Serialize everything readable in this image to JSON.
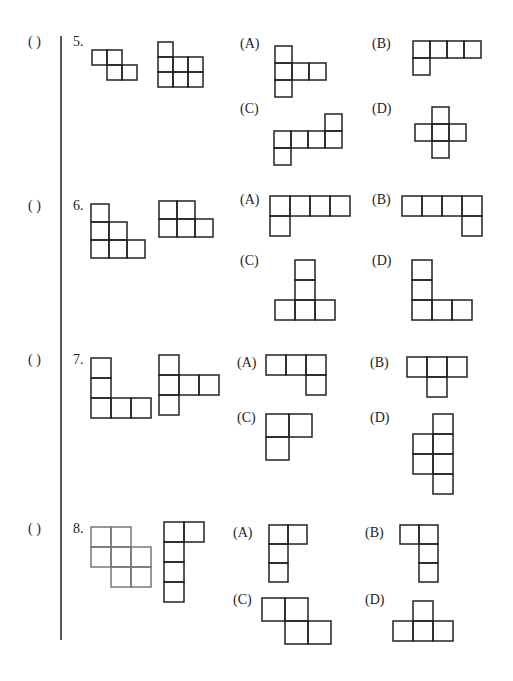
{
  "worksheet": {
    "questions": [
      {
        "number": "5.",
        "answer_blank": "(     )",
        "layout": {
          "paren": [
            28,
            34
          ],
          "num": [
            73,
            34
          ]
        },
        "given_shapes": [
          {
            "origin": [
              92,
              50
            ],
            "cell": 15,
            "stroke": "#222222",
            "cells": [
              [
                0,
                0
              ],
              [
                1,
                0
              ],
              [
                1,
                1
              ],
              [
                2,
                1
              ]
            ]
          },
          {
            "origin": [
              158,
              42
            ],
            "cell": 15,
            "stroke": "#222222",
            "cells": [
              [
                0,
                0
              ],
              [
                0,
                1
              ],
              [
                1,
                1
              ],
              [
                2,
                1
              ],
              [
                0,
                2
              ],
              [
                1,
                2
              ],
              [
                2,
                2
              ]
            ]
          }
        ],
        "options": [
          {
            "label": "(A)",
            "label_pos": [
              240,
              36
            ],
            "origin": [
              275,
              46
            ],
            "cell": 17,
            "cells": [
              [
                0,
                0
              ],
              [
                0,
                1
              ],
              [
                1,
                1
              ],
              [
                2,
                1
              ],
              [
                0,
                2
              ]
            ]
          },
          {
            "label": "(B)",
            "label_pos": [
              372,
              36
            ],
            "origin": [
              413,
              41
            ],
            "cell": 17,
            "cells": [
              [
                0,
                0
              ],
              [
                1,
                0
              ],
              [
                2,
                0
              ],
              [
                3,
                0
              ],
              [
                0,
                1
              ]
            ]
          },
          {
            "label": "(C)",
            "label_pos": [
              240,
              101
            ],
            "origin": [
              274,
              114
            ],
            "cell": 17,
            "cells": [
              [
                3,
                0
              ],
              [
                0,
                1
              ],
              [
                1,
                1
              ],
              [
                2,
                1
              ],
              [
                3,
                1
              ],
              [
                0,
                2
              ]
            ]
          },
          {
            "label": "(D)",
            "label_pos": [
              372,
              101
            ],
            "origin": [
              415,
              107
            ],
            "cell": 17,
            "cells": [
              [
                1,
                0
              ],
              [
                0,
                1
              ],
              [
                1,
                1
              ],
              [
                2,
                1
              ],
              [
                1,
                2
              ]
            ]
          }
        ]
      },
      {
        "number": "6.",
        "answer_blank": "(     )",
        "layout": {
          "paren": [
            28,
            198
          ],
          "num": [
            73,
            198
          ]
        },
        "given_shapes": [
          {
            "origin": [
              91,
              204
            ],
            "cell": 18,
            "stroke": "#222222",
            "cells": [
              [
                0,
                0
              ],
              [
                0,
                1
              ],
              [
                1,
                1
              ],
              [
                0,
                2
              ],
              [
                1,
                2
              ],
              [
                2,
                2
              ]
            ]
          },
          {
            "origin": [
              159,
              201
            ],
            "cell": 18,
            "stroke": "#222222",
            "cells": [
              [
                0,
                0
              ],
              [
                1,
                0
              ],
              [
                0,
                1
              ],
              [
                1,
                1
              ],
              [
                2,
                1
              ]
            ]
          }
        ],
        "options": [
          {
            "label": "(A)",
            "label_pos": [
              240,
              192
            ],
            "origin": [
              270,
              196
            ],
            "cell": 20,
            "cells": [
              [
                0,
                0
              ],
              [
                1,
                0
              ],
              [
                2,
                0
              ],
              [
                3,
                0
              ],
              [
                0,
                1
              ]
            ]
          },
          {
            "label": "(B)",
            "label_pos": [
              372,
              192
            ],
            "origin": [
              402,
              196
            ],
            "cell": 20,
            "cells": [
              [
                0,
                0
              ],
              [
                1,
                0
              ],
              [
                2,
                0
              ],
              [
                3,
                0
              ],
              [
                3,
                1
              ]
            ]
          },
          {
            "label": "(C)",
            "label_pos": [
              240,
              253
            ],
            "origin": [
              275,
              260
            ],
            "cell": 20,
            "cells": [
              [
                1,
                0
              ],
              [
                1,
                1
              ],
              [
                0,
                2
              ],
              [
                1,
                2
              ],
              [
                2,
                2
              ]
            ]
          },
          {
            "label": "(D)",
            "label_pos": [
              372,
              253
            ],
            "origin": [
              412,
              260
            ],
            "cell": 20,
            "cells": [
              [
                0,
                0
              ],
              [
                0,
                1
              ],
              [
                0,
                2
              ],
              [
                1,
                2
              ],
              [
                2,
                2
              ]
            ]
          }
        ]
      },
      {
        "number": "7.",
        "answer_blank": "(     )",
        "layout": {
          "paren": [
            28,
            352
          ],
          "num": [
            73,
            352
          ]
        },
        "given_shapes": [
          {
            "origin": [
              91,
              358
            ],
            "cell": 20,
            "stroke": "#222222",
            "cells": [
              [
                0,
                0
              ],
              [
                0,
                1
              ],
              [
                0,
                2
              ],
              [
                1,
                2
              ],
              [
                2,
                2
              ]
            ]
          },
          {
            "origin": [
              159,
              355
            ],
            "cell": 20,
            "stroke": "#222222",
            "cells": [
              [
                0,
                0
              ],
              [
                0,
                1
              ],
              [
                1,
                1
              ],
              [
                2,
                1
              ],
              [
                0,
                2
              ]
            ]
          }
        ],
        "options": [
          {
            "label": "(A)",
            "label_pos": [
              237,
              355
            ],
            "origin": [
              266,
              355
            ],
            "cell": 20,
            "cells": [
              [
                0,
                0
              ],
              [
                1,
                0
              ],
              [
                2,
                0
              ],
              [
                2,
                1
              ]
            ]
          },
          {
            "label": "(B)",
            "label_pos": [
              370,
              355
            ],
            "origin": [
              407,
              357
            ],
            "cell": 20,
            "cells": [
              [
                0,
                0
              ],
              [
                1,
                0
              ],
              [
                2,
                0
              ],
              [
                1,
                1
              ]
            ]
          },
          {
            "label": "(C)",
            "label_pos": [
              237,
              410
            ],
            "origin": [
              266,
              414
            ],
            "cell": 23,
            "cells": [
              [
                0,
                0
              ],
              [
                1,
                0
              ],
              [
                0,
                1
              ]
            ]
          },
          {
            "label": "(D)",
            "label_pos": [
              370,
              410
            ],
            "origin": [
              413,
              414
            ],
            "cell": 20,
            "cells": [
              [
                1,
                0
              ],
              [
                0,
                1
              ],
              [
                1,
                1
              ],
              [
                0,
                2
              ],
              [
                1,
                2
              ],
              [
                1,
                3
              ]
            ]
          }
        ]
      },
      {
        "number": "8.",
        "answer_blank": "(     )",
        "layout": {
          "paren": [
            28,
            521
          ],
          "num": [
            73,
            521
          ]
        },
        "given_shapes": [
          {
            "origin": [
              91,
              527
            ],
            "cell": 20,
            "stroke": "#777777",
            "cells": [
              [
                0,
                0
              ],
              [
                1,
                0
              ],
              [
                0,
                1
              ],
              [
                1,
                1
              ],
              [
                2,
                1
              ],
              [
                1,
                2
              ],
              [
                2,
                2
              ]
            ]
          },
          {
            "origin": [
              164,
              522
            ],
            "cell": 20,
            "stroke": "#222222",
            "cells": [
              [
                0,
                0
              ],
              [
                1,
                0
              ],
              [
                0,
                1
              ],
              [
                0,
                2
              ],
              [
                0,
                3
              ]
            ]
          }
        ],
        "options": [
          {
            "label": "(A)",
            "label_pos": [
              233,
              525
            ],
            "origin": [
              269,
              525
            ],
            "cell": 19,
            "cells": [
              [
                0,
                0
              ],
              [
                1,
                0
              ],
              [
                0,
                1
              ],
              [
                0,
                2
              ]
            ]
          },
          {
            "label": "(B)",
            "label_pos": [
              365,
              525
            ],
            "origin": [
              400,
              525
            ],
            "cell": 19,
            "cells": [
              [
                0,
                0
              ],
              [
                1,
                0
              ],
              [
                1,
                1
              ],
              [
                1,
                2
              ]
            ]
          },
          {
            "label": "(C)",
            "label_pos": [
              233,
              592
            ],
            "origin": [
              262,
              598
            ],
            "cell": 23,
            "cells": [
              [
                0,
                0
              ],
              [
                1,
                0
              ],
              [
                1,
                1
              ],
              [
                2,
                1
              ]
            ]
          },
          {
            "label": "(D)",
            "label_pos": [
              365,
              592
            ],
            "origin": [
              393,
              601
            ],
            "cell": 20,
            "cells": [
              [
                1,
                0
              ],
              [
                0,
                1
              ],
              [
                1,
                1
              ],
              [
                2,
                1
              ]
            ]
          }
        ]
      }
    ]
  },
  "style": {
    "stroke": "#222222",
    "divider": "#555555",
    "background": "#ffffff"
  }
}
